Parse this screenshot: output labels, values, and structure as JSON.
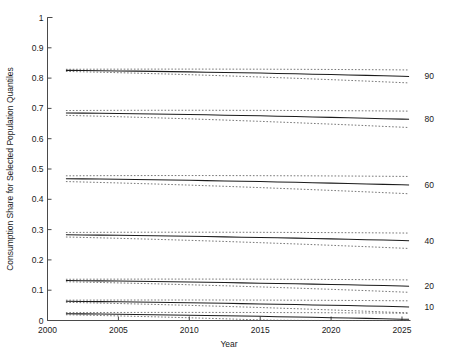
{
  "chart_data": {
    "type": "line",
    "title": "",
    "xlabel": "Year",
    "ylabel": "Consumption Share for Selected Population Quantiles",
    "xlim": [
      2000,
      2025.6
    ],
    "ylim": [
      0,
      1
    ],
    "xticks": [
      2000,
      2005,
      2010,
      2015,
      2020,
      2025
    ],
    "xticklabels": [
      "2000",
      "2005",
      "2010",
      "2015",
      "2020",
      "2025"
    ],
    "yticks": [
      0,
      0.1,
      0.2,
      0.3,
      0.4,
      0.5,
      0.6,
      0.7,
      0.8,
      0.9,
      1
    ],
    "yticklabels": [
      "0",
      "0.1",
      "0.2",
      "0.3",
      "0.4",
      "0.5",
      "0.6",
      "0.7",
      "0.8",
      "0.9",
      "1"
    ],
    "grid": false,
    "legend_position": "right-inline-end-labels",
    "x": [
      2001.3,
      2002.5,
      2003.7,
      2005.0,
      2006.2,
      2007.5,
      2008.7,
      2010.0,
      2011.2,
      2012.5,
      2013.7,
      2015.0,
      2016.2,
      2017.5,
      2018.7,
      2020.0,
      2021.2,
      2022.5,
      2023.7,
      2025.0,
      2025.5
    ],
    "series": [
      {
        "name": "90",
        "end_label": "90",
        "style": "solid",
        "values": [
          0.8255,
          0.825,
          0.8244,
          0.8237,
          0.823,
          0.8222,
          0.8214,
          0.8205,
          0.8196,
          0.8186,
          0.8176,
          0.8165,
          0.8154,
          0.8142,
          0.813,
          0.8117,
          0.8104,
          0.809,
          0.8076,
          0.8061,
          0.8055
        ],
        "upper": [
          0.829,
          0.8292,
          0.8294,
          0.8295,
          0.8296,
          0.8297,
          0.8297,
          0.8297,
          0.8297,
          0.8296,
          0.8295,
          0.8294,
          0.8292,
          0.829,
          0.8288,
          0.8285,
          0.8282,
          0.8279,
          0.8275,
          0.8271,
          0.8269
        ],
        "lower": [
          0.822,
          0.8208,
          0.8194,
          0.8179,
          0.8164,
          0.8147,
          0.8131,
          0.8113,
          0.8095,
          0.8076,
          0.8057,
          0.8036,
          0.8016,
          0.7994,
          0.7972,
          0.7949,
          0.7926,
          0.7901,
          0.7877,
          0.7851,
          0.7841
        ]
      },
      {
        "name": "80",
        "end_label": "80",
        "style": "solid",
        "values": [
          0.685,
          0.6844,
          0.6838,
          0.6831,
          0.6823,
          0.6815,
          0.6806,
          0.6797,
          0.6787,
          0.6776,
          0.6766,
          0.6754,
          0.6742,
          0.673,
          0.6717,
          0.6704,
          0.669,
          0.6676,
          0.6661,
          0.6646,
          0.664
        ],
        "upper": [
          0.693,
          0.6932,
          0.6934,
          0.6936,
          0.6937,
          0.6938,
          0.6938,
          0.6938,
          0.6938,
          0.6937,
          0.6936,
          0.6935,
          0.6933,
          0.6931,
          0.6929,
          0.6926,
          0.6923,
          0.692,
          0.6916,
          0.6912,
          0.691
        ],
        "lower": [
          0.677,
          0.6756,
          0.6742,
          0.6726,
          0.6709,
          0.6692,
          0.6674,
          0.6656,
          0.6636,
          0.6615,
          0.6594,
          0.6573,
          0.6551,
          0.6528,
          0.6505,
          0.6481,
          0.6457,
          0.6432,
          0.6406,
          0.638,
          0.6369
        ]
      },
      {
        "name": "60",
        "end_label": "60",
        "style": "solid",
        "values": [
          0.468,
          0.4674,
          0.4667,
          0.466,
          0.4652,
          0.4644,
          0.4635,
          0.4626,
          0.4616,
          0.4606,
          0.4595,
          0.4584,
          0.4572,
          0.456,
          0.4547,
          0.4534,
          0.452,
          0.4506,
          0.4492,
          0.4477,
          0.4471
        ],
        "upper": [
          0.4775,
          0.4778,
          0.478,
          0.4782,
          0.4783,
          0.4784,
          0.4784,
          0.4784,
          0.4784,
          0.4783,
          0.4782,
          0.478,
          0.4778,
          0.4776,
          0.4774,
          0.4771,
          0.4768,
          0.4764,
          0.476,
          0.4756,
          0.4754
        ],
        "lower": [
          0.4585,
          0.4571,
          0.4556,
          0.454,
          0.4523,
          0.4506,
          0.4488,
          0.4469,
          0.4449,
          0.4429,
          0.4408,
          0.4386,
          0.4364,
          0.4341,
          0.4318,
          0.4294,
          0.427,
          0.4245,
          0.422,
          0.4194,
          0.4183
        ]
      },
      {
        "name": "40",
        "end_label": "40",
        "style": "solid",
        "values": [
          0.283,
          0.2824,
          0.2818,
          0.2811,
          0.2804,
          0.2796,
          0.2788,
          0.2779,
          0.277,
          0.276,
          0.275,
          0.274,
          0.2729,
          0.2718,
          0.2706,
          0.2694,
          0.2681,
          0.2668,
          0.2655,
          0.2641,
          0.2635
        ],
        "upper": [
          0.2905,
          0.2908,
          0.291,
          0.2912,
          0.2913,
          0.2914,
          0.2914,
          0.2914,
          0.2914,
          0.2913,
          0.2912,
          0.291,
          0.2908,
          0.2906,
          0.2904,
          0.2901,
          0.2898,
          0.2895,
          0.2891,
          0.2887,
          0.2885
        ],
        "lower": [
          0.2755,
          0.2742,
          0.2728,
          0.2713,
          0.2697,
          0.2681,
          0.2664,
          0.2646,
          0.2628,
          0.2609,
          0.2589,
          0.2569,
          0.2548,
          0.2527,
          0.2505,
          0.2482,
          0.2459,
          0.2436,
          0.2412,
          0.2387,
          0.2377
        ]
      },
      {
        "name": "20",
        "end_label": "20",
        "style": "solid",
        "values": [
          0.132,
          0.1314,
          0.1308,
          0.1301,
          0.1294,
          0.1286,
          0.1278,
          0.127,
          0.1261,
          0.1252,
          0.1242,
          0.1232,
          0.1222,
          0.1211,
          0.12,
          0.1189,
          0.1177,
          0.1165,
          0.1152,
          0.1139,
          0.1133
        ],
        "upper": [
          0.136,
          0.1362,
          0.1364,
          0.1365,
          0.1366,
          0.1367,
          0.1367,
          0.1367,
          0.1367,
          0.1366,
          0.1365,
          0.1364,
          0.1362,
          0.136,
          0.1358,
          0.1355,
          0.1352,
          0.1349,
          0.1345,
          0.1341,
          0.1339
        ],
        "lower": [
          0.128,
          0.1268,
          0.1255,
          0.1241,
          0.1227,
          0.1212,
          0.1196,
          0.118,
          0.1163,
          0.1146,
          0.1128,
          0.1109,
          0.109,
          0.107,
          0.105,
          0.1029,
          0.1008,
          0.0986,
          0.0963,
          0.094,
          0.093
        ]
      },
      {
        "name": "10",
        "end_label": "10",
        "style": "solid",
        "values": [
          0.0635,
          0.0629,
          0.0623,
          0.0616,
          0.0609,
          0.0601,
          0.0593,
          0.0585,
          0.0576,
          0.0567,
          0.0557,
          0.0547,
          0.0537,
          0.0526,
          0.0515,
          0.0504,
          0.0492,
          0.048,
          0.0467,
          0.0454,
          0.0448
        ],
        "upper": [
          0.067,
          0.0672,
          0.0674,
          0.0675,
          0.0676,
          0.0677,
          0.0677,
          0.0677,
          0.0677,
          0.0676,
          0.0675,
          0.0674,
          0.0672,
          0.067,
          0.0668,
          0.0665,
          0.0662,
          0.0659,
          0.0655,
          0.0651,
          0.0649
        ],
        "lower": [
          0.06,
          0.0588,
          0.0575,
          0.0561,
          0.0547,
          0.0532,
          0.0516,
          0.05,
          0.0483,
          0.0466,
          0.0448,
          0.0429,
          0.041,
          0.039,
          0.037,
          0.0349,
          0.0328,
          0.0306,
          0.0283,
          0.026,
          0.025
        ]
      },
      {
        "name": "5",
        "end_label": "",
        "style": "solid",
        "values": [
          0.0225,
          0.0219,
          0.0213,
          0.0206,
          0.0199,
          0.0191,
          0.0183,
          0.0175,
          0.0166,
          0.0157,
          0.0147,
          0.0137,
          0.0127,
          0.0116,
          0.0105,
          0.0094,
          0.0082,
          0.007,
          0.0057,
          0.0044,
          0.0038
        ],
        "upper": [
          0.026,
          0.0262,
          0.0264,
          0.0265,
          0.0266,
          0.0267,
          0.0267,
          0.0267,
          0.0267,
          0.0266,
          0.0265,
          0.0264,
          0.0262,
          0.026,
          0.0258,
          0.0255,
          0.0252,
          0.0249,
          0.0245,
          0.0241,
          0.0239
        ],
        "lower": [
          0.019,
          0.0178,
          0.0165,
          0.0151,
          0.0137,
          0.0122,
          0.0106,
          0.009,
          0.0073,
          0.0056,
          0.0038,
          0.002,
          0.001,
          0.0005,
          0.0002,
          0.0001,
          0.0,
          0.0,
          0.0,
          0.0,
          0.0
        ]
      }
    ]
  },
  "axes": {
    "xlabel": "Year",
    "ylabel": "Consumption Share for Selected Population Quantiles"
  }
}
